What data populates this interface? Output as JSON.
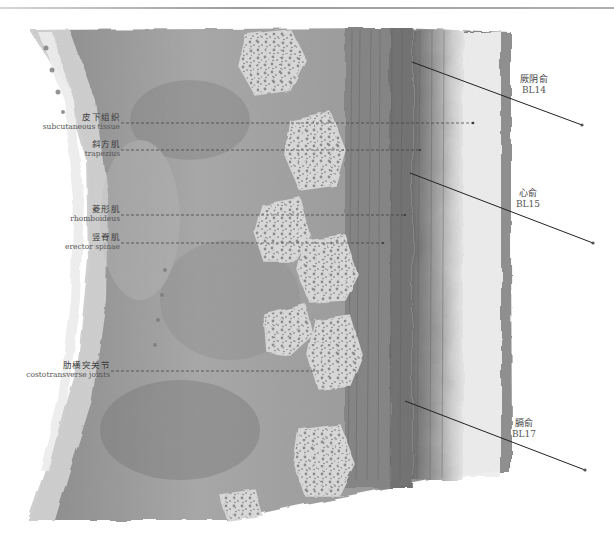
{
  "figure": {
    "left_labels": [
      {
        "id": "subcutaneous",
        "zh": "皮下组织",
        "en": "subcutaneous tissue"
      },
      {
        "id": "trapezius",
        "zh": "斜方肌",
        "en": "trapezius"
      },
      {
        "id": "rhomboideus",
        "zh": "菱形肌",
        "en": "rhomboideus"
      },
      {
        "id": "erector",
        "zh": "竖脊肌",
        "en": "erector spinae"
      },
      {
        "id": "costotransverse",
        "zh": "肋横突关节",
        "en": "costotransverse joints"
      }
    ],
    "acupoints": [
      {
        "id": "bl14",
        "zh": "厥阴俞",
        "code": "BL14"
      },
      {
        "id": "bl15",
        "zh": "心俞",
        "code": "BL15"
      },
      {
        "id": "bl17",
        "zh": "膈俞",
        "code": "BL17"
      }
    ],
    "colors": {
      "ink": "#3a3a3a",
      "muscle_dark": "#6e6e6e",
      "muscle_mid": "#9a9a9a",
      "bone_light": "#d8d8d8",
      "skin_light": "#ececec"
    }
  }
}
